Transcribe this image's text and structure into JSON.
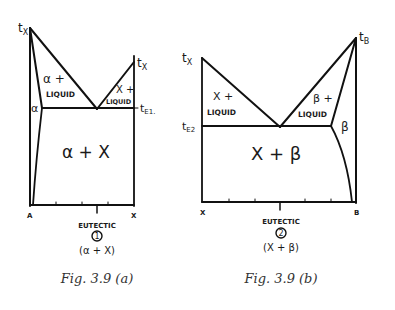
{
  "figures": [
    {
      "id": "a",
      "caption": "Fig. 3.9 (a)",
      "top_left_label": "tX",
      "top_right_label": "tX",
      "eutectic_temp_label": "tE1",
      "regions": {
        "alpha_liquid_1": "α +",
        "alpha_liquid_2": "LIQUID",
        "x_liquid_1": "X +",
        "x_liquid_2": "LIQUID",
        "alpha": "α",
        "alpha_x": "α + X"
      },
      "axis_left": "A",
      "axis_right": "X",
      "eutectic_label": "EUTECTIC",
      "eutectic_number": "1",
      "eutectic_phases": "(α + X)"
    },
    {
      "id": "b",
      "caption": "Fig. 3.9 (b)",
      "top_left_label": "tX",
      "top_right_label": "tB",
      "eutectic_temp_label": "tE2",
      "regions": {
        "x_liquid_1": "X +",
        "x_liquid_2": "LIQUID",
        "beta_liquid_1": "β +",
        "beta_liquid_2": "LIQUID",
        "beta": "β",
        "x_beta": "X + β"
      },
      "axis_left": "X",
      "axis_right": "B",
      "eutectic_label": "EUTECTIC",
      "eutectic_number": "2",
      "eutectic_phases": "(X + β)"
    }
  ]
}
